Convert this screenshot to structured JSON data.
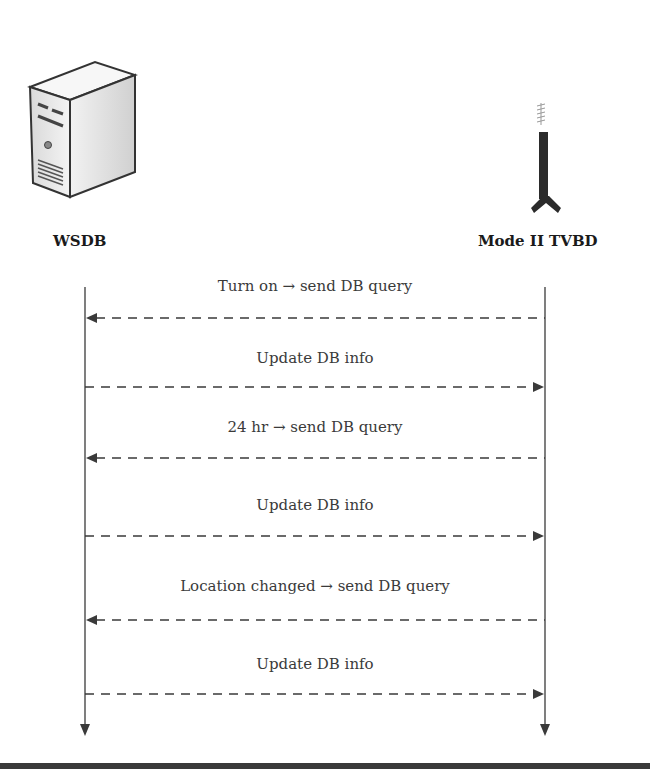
{
  "actors": [
    {
      "id": "wsdb",
      "label": "WSDB",
      "icon": "server-icon"
    },
    {
      "id": "tvbd",
      "label": "Mode II TVBD",
      "icon": "antenna-icon"
    }
  ],
  "messages": [
    {
      "label": "Turn on → send DB query",
      "from": "Mode II TVBD",
      "to": "WSDB",
      "style": "dashed"
    },
    {
      "label": "Update DB info",
      "from": "WSDB",
      "to": "Mode II TVBD",
      "style": "dashed"
    },
    {
      "label": "24 hr → send DB query",
      "from": "Mode II TVBD",
      "to": "WSDB",
      "style": "dashed"
    },
    {
      "label": "Update DB info",
      "from": "WSDB",
      "to": "Mode II TVBD",
      "style": "dashed"
    },
    {
      "label": "Location changed → send DB query",
      "from": "Mode II TVBD",
      "to": "WSDB",
      "style": "dashed"
    },
    {
      "label": "Update DB info",
      "from": "WSDB",
      "to": "Mode II TVBD",
      "style": "dashed"
    }
  ],
  "colors": {
    "line": "#3a3a3a",
    "text": "#333333",
    "background": "#ffffff"
  }
}
